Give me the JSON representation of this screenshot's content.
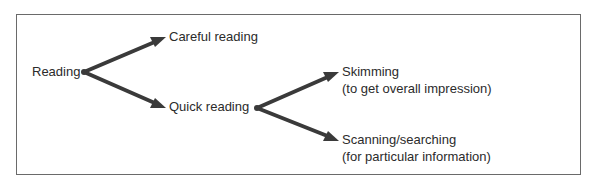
{
  "diagram": {
    "type": "tree",
    "root": {
      "label": "Reading",
      "children": [
        {
          "label": "Careful reading"
        },
        {
          "label": "Quick reading",
          "children": [
            {
              "label": "Skimming",
              "sublabel": "(to get overall impression)"
            },
            {
              "label": "Scanning/searching",
              "sublabel": "(for particular information)"
            }
          ]
        }
      ]
    }
  },
  "nodes": {
    "reading": "Reading",
    "careful_reading": "Careful reading",
    "quick_reading": "Quick reading",
    "skimming": "Skimming",
    "skimming_note": "(to get overall impression)",
    "scanning": "Scanning/searching",
    "scanning_note": "(for particular information)"
  },
  "colors": {
    "arrow": "#3a3a3a",
    "border": "#6a6a6a",
    "text": "#2b2b2b",
    "background": "#ffffff"
  }
}
